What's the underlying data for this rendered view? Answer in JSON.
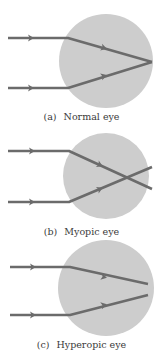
{
  "colors": {
    "eyeball": "#cdcdcd",
    "ray": "#6b6b6b",
    "text": "#3a3a3a"
  },
  "panels": [
    {
      "tag": "(a)",
      "caption": "Normal eye",
      "circle": {
        "cx": 106,
        "cy": 61,
        "r": 47
      },
      "rays": [
        {
          "points": "8,38 68,38 152,62",
          "arrows": [
            [
              31,
              38
            ],
            [
              104,
              48
            ]
          ]
        },
        {
          "points": "8,88 68,88 152,62",
          "arrows": [
            [
              31,
              88
            ],
            [
              104,
              76
            ]
          ]
        }
      ],
      "label_y": 111
    },
    {
      "tag": "(b)",
      "caption": "Myopic eye",
      "circle": {
        "cx": 106,
        "cy": 176,
        "r": 43
      },
      "rays": [
        {
          "points": "8,151 69,151 152,189",
          "arrows": [
            [
              32,
              151
            ],
            [
              100,
              165
            ]
          ]
        },
        {
          "points": "8,202 69,202 152,167",
          "arrows": [
            [
              32,
              202
            ],
            [
              100,
              189
            ]
          ]
        }
      ],
      "label_y": 226
    },
    {
      "tag": "(c)",
      "caption": "Hyperopic eye",
      "circle": {
        "cx": 106,
        "cy": 288,
        "r": 48
      },
      "rays": [
        {
          "points": "10,267 70,267 148,284",
          "arrows": [
            [
              33,
              267
            ],
            [
              104,
              277
            ]
          ]
        },
        {
          "points": "10,315 70,315 148,295",
          "arrows": [
            [
              33,
              315
            ],
            [
              104,
              305
            ]
          ]
        }
      ],
      "label_y": 339
    }
  ]
}
